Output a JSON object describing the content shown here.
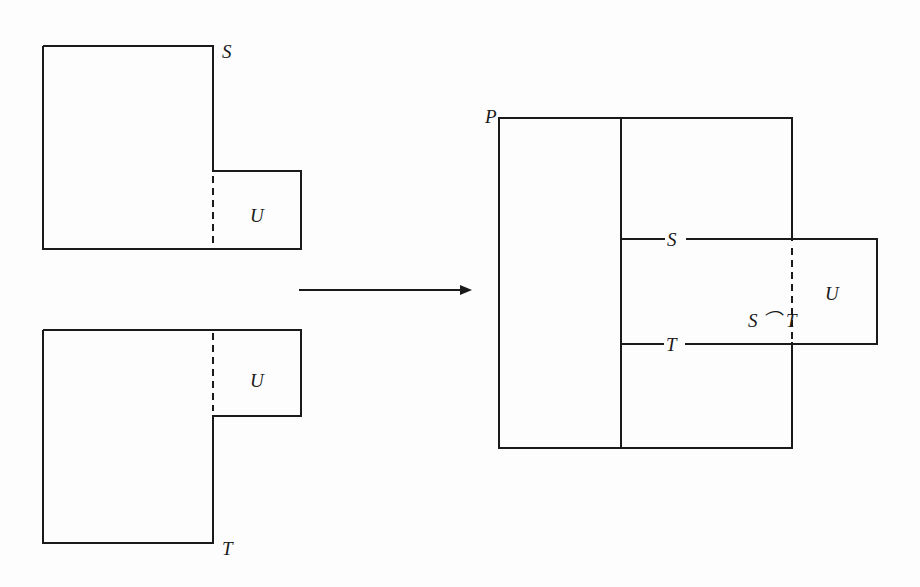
{
  "diagram": {
    "type": "set-gluing-diagram",
    "left_top_shape": {
      "name_label": "S",
      "region_label": "U"
    },
    "left_bottom_shape": {
      "name_label": "T",
      "region_label": "U"
    },
    "arrow": {
      "direction": "right"
    },
    "right_shape": {
      "outer_label": "P",
      "upper_line_label": "S",
      "lower_line_label": "T",
      "intersection_label": "S ⌒ T",
      "region_label": "U"
    }
  },
  "colors": {
    "line": "#1a1a1a",
    "background": "#fdfdfd"
  }
}
